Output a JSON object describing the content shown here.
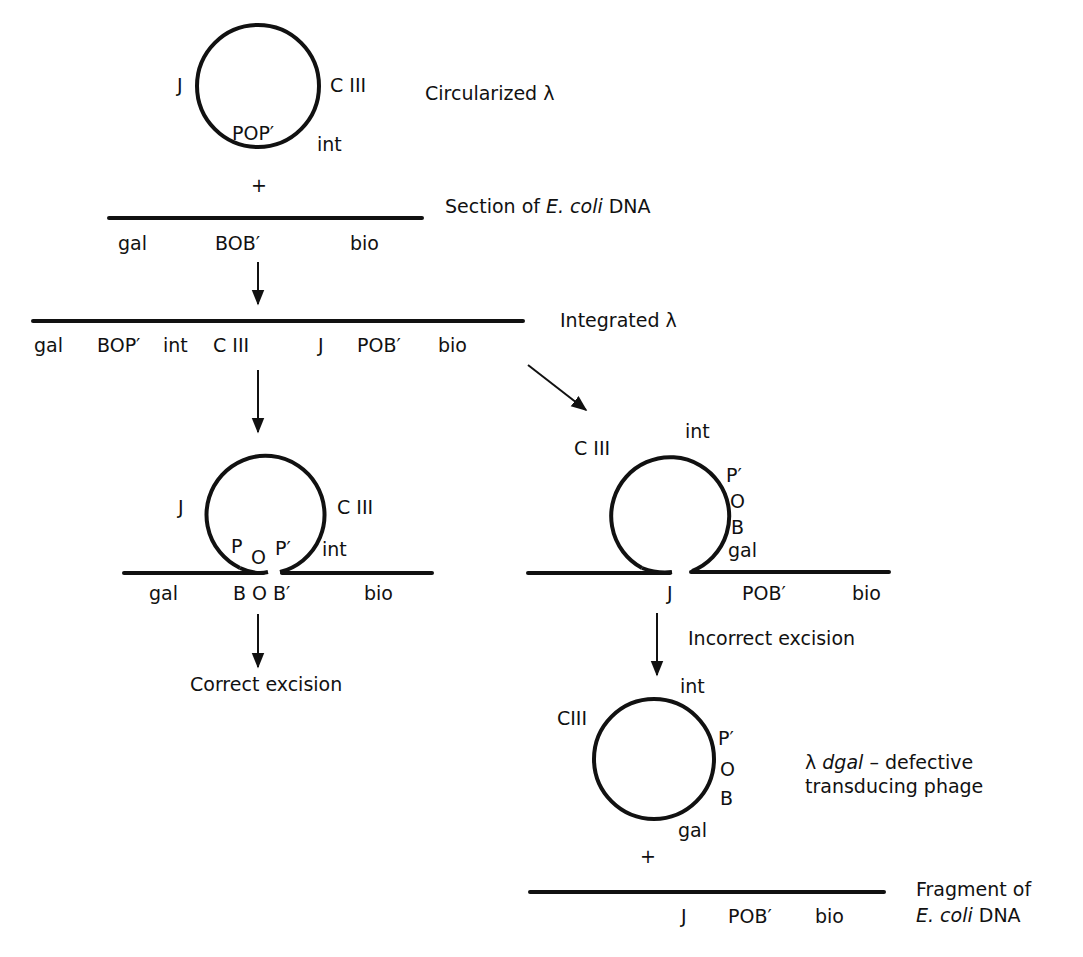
{
  "figure": {
    "stage1": {
      "circle_labels": {
        "left": "J",
        "right": "C III",
        "bottom": "POP′",
        "bottom_right": "int"
      },
      "caption": "Circularized λ",
      "plus": "+"
    },
    "stage2": {
      "labels": [
        "gal",
        "BOB′",
        "bio"
      ],
      "caption_prefix": "Section of ",
      "caption_italic": "E. coli",
      "caption_suffix": " DNA"
    },
    "stage3": {
      "labels": [
        "gal",
        "BOP′",
        "int",
        "C III",
        "J",
        "POB′",
        "bio"
      ],
      "caption": "Integrated λ"
    },
    "correct_branch": {
      "circle_labels": {
        "left": "J",
        "right": "C III",
        "p": "P",
        "o": "O",
        "p_prime": "P′",
        "int": "int"
      },
      "line_labels": [
        "gal",
        "B O B′",
        "bio"
      ],
      "caption": "Correct excision"
    },
    "incorrect_branch": {
      "circle_labels": {
        "c3": "C III",
        "int": "int",
        "p_prime": "P′",
        "o": "O",
        "b": "B",
        "gal": "gal"
      },
      "line_labels": [
        "J",
        "POB′",
        "bio"
      ],
      "caption": "Incorrect excision"
    },
    "product": {
      "circle_labels": {
        "c3": "CIII",
        "int": "int",
        "p_prime": "P′",
        "o": "O",
        "b": "B",
        "gal": "gal"
      },
      "caption_prefix": "λ ",
      "caption_italic": "dgal",
      "caption_line1_suffix": " – defective",
      "caption_line2": "transducing phage",
      "plus": "+"
    },
    "fragment": {
      "line_labels": [
        "J",
        "POB′",
        "bio"
      ],
      "caption_line1": "Fragment of",
      "caption_line2_italic": "E. coli",
      "caption_line2_suffix": " DNA"
    }
  }
}
